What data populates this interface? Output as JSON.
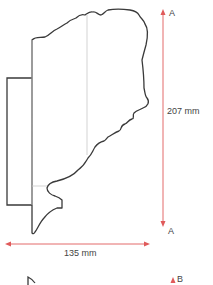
{
  "drawing": {
    "title": "Cornice profile section",
    "colors": {
      "profile_stroke": "#3a3a3a",
      "guide_stroke": "#c8c8c8",
      "dimension": "#e05a5a",
      "text": "#444444",
      "background": "#ffffff"
    },
    "dimensions": {
      "height": {
        "value": "207 mm",
        "end_label_top": "A",
        "end_label_bottom": "A"
      },
      "width": {
        "value": "135 mm"
      }
    },
    "section_marker": {
      "label": "B"
    }
  }
}
